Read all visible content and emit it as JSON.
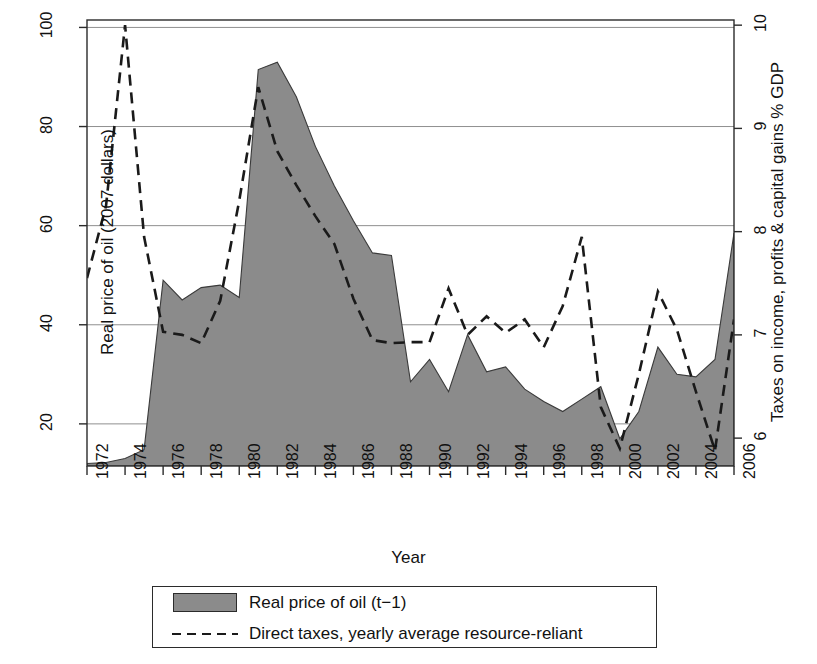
{
  "chart_data": {
    "type": "area",
    "title": "",
    "xlabel": "Year",
    "ylabel": "Real price of oil (2007 dollars)",
    "ylabel_right": "Taxes on income, profits & capital gains % GDP",
    "grid": true,
    "legend_position": "bottom",
    "x": [
      1972,
      1973,
      1974,
      1975,
      1976,
      1977,
      1978,
      1979,
      1980,
      1981,
      1982,
      1983,
      1984,
      1985,
      1986,
      1987,
      1988,
      1989,
      1990,
      1991,
      1992,
      1993,
      1994,
      1995,
      1996,
      1997,
      1998,
      1999,
      2000,
      2001,
      2002,
      2003,
      2004,
      2005,
      2006
    ],
    "xlim": [
      1972,
      2006
    ],
    "xticks": [
      1972,
      1974,
      1976,
      1978,
      1980,
      1982,
      1984,
      1986,
      1988,
      1990,
      1992,
      1994,
      1996,
      1998,
      2000,
      2002,
      2004,
      2006
    ],
    "xtick_labels": [
      "1972",
      "1974",
      "1976",
      "1978",
      "1980",
      "1982",
      "1984",
      "1986",
      "1988",
      "1990",
      "1992",
      "1994",
      "1996",
      "1998",
      "2000",
      "2002",
      "2004",
      "2006"
    ],
    "ylim": [
      11.5,
      101.5
    ],
    "yticks": [
      20,
      40,
      60,
      80,
      100
    ],
    "ytick_labels": [
      "20",
      "40",
      "60",
      "80",
      "100"
    ],
    "ylim_right": [
      5.73,
      10.05
    ],
    "yticks_right": [
      6,
      7,
      8,
      9,
      10
    ],
    "ytick_labels_right": [
      "6",
      "7",
      "8",
      "9",
      "10"
    ],
    "series": [
      {
        "name": "Real price of oil (t−1)",
        "type": "area",
        "axis": "left",
        "color": "#8b8b8b",
        "values": [
          12.0,
          12.2,
          13.0,
          14.8,
          49.0,
          45.0,
          47.5,
          48.0,
          45.5,
          91.5,
          93.0,
          86.0,
          76.0,
          68.0,
          61.0,
          54.5,
          54.0,
          28.5,
          33.0,
          26.5,
          38.0,
          30.5,
          31.5,
          27.0,
          24.5,
          22.5,
          25.0,
          27.5,
          17.0,
          22.5,
          35.5,
          30.0,
          29.5,
          33.0,
          58.5
        ]
      },
      {
        "name": "Direct taxes, yearly average resource-reliant",
        "type": "line",
        "axis": "right",
        "style": "dashed",
        "color": "#1a1a1a",
        "values": [
          7.55,
          8.25,
          10.0,
          7.95,
          7.03,
          7.0,
          6.92,
          7.33,
          8.3,
          9.4,
          8.78,
          8.45,
          8.15,
          7.88,
          7.35,
          6.95,
          6.92,
          6.93,
          6.93,
          7.45,
          7.0,
          7.18,
          7.02,
          7.15,
          6.88,
          7.28,
          7.95,
          6.3,
          5.9,
          6.62,
          7.42,
          7.05,
          6.45,
          5.88,
          7.15
        ]
      }
    ]
  },
  "axes": {
    "xlabel": "Year",
    "ylabel_left": "Real price of oil (2007 dollars)",
    "ylabel_right": "Taxes on income, profits & capital gains % GDP"
  },
  "legend": {
    "items": [
      {
        "label": "Real price of oil (t−1)",
        "key": "area-swatch"
      },
      {
        "label": "Direct taxes, yearly average resource-reliant",
        "key": "dashed-line"
      }
    ]
  },
  "colors": {
    "area_fill": "#8b8b8b",
    "line": "#1a1a1a",
    "grid": "#8f8f8f",
    "frame": "#2b2b2b"
  }
}
